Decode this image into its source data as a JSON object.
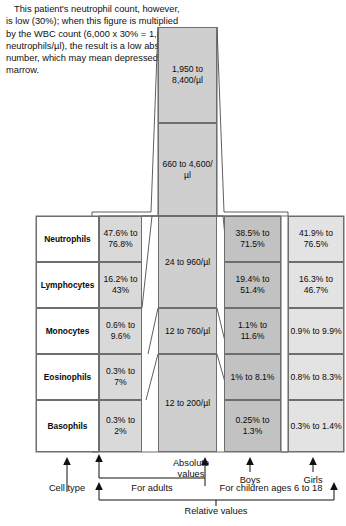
{
  "annotation": {
    "text": "This patient's neutrophil count, however, is low (30%); when this figure is multiplied by the WBC count (6,000 x 30% = 1,800 neutrophils/µl), the result is a low absolute number, which may mean depressed bone marrow."
  },
  "table": {
    "row_labels": [
      "Neutrophils",
      "Lymphocytes",
      "Monocytes",
      "Eosinophils",
      "Basophils"
    ],
    "adults_relative": [
      "47.6% to 76.8%",
      "16.2% to 43%",
      "0.6% to 9.6%",
      "0.3% to 7%",
      "0.3% to 2%"
    ],
    "boys_relative": [
      "38.5% to 71.5%",
      "19.4% to 51.4%",
      "1.1% to 11.6%",
      "1% to 8.1%",
      "0.25% to 1.3%"
    ],
    "girls_relative": [
      "41.9% to 76.5%",
      "16.3% to 46.7%",
      "0.9% to 9.9%",
      "0.8% to 8.3%",
      "0.3% to 1.4%"
    ]
  },
  "absolute_column": {
    "segments": [
      "1,950 to 8,400/µl",
      "660 to 4,600/µl",
      "24 to 960/µl",
      "12 to 760/µl",
      "12 to 200/µl"
    ]
  },
  "axis_labels": {
    "cell_type": "Cell type",
    "for_adults": "For adults",
    "absolute_values": "Absolute values",
    "boys": "Boys",
    "girls": "Girls",
    "for_children": "For children ages 6 to 18",
    "relative_values": "Relative values"
  },
  "colors": {
    "adults_fill": "#d9d9d9",
    "boys_fill": "#c2c2c2",
    "girls_fill": "#e3e3e3",
    "center_fill": "#cfcfcf",
    "label_fill": "#ffffff",
    "stroke": "#6e6e6e",
    "ink": "#111111"
  }
}
